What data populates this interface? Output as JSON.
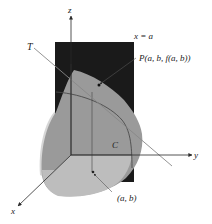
{
  "diagram": {
    "type": "3d-surface-tangent-line",
    "labels": {
      "z_axis": "z",
      "y_axis": "y",
      "x_axis": "x",
      "plane": "x = a",
      "tangent": "T",
      "point": "P(a, b, f(a, b))",
      "curve": "C",
      "base_point": "(a, b)"
    },
    "colors": {
      "plane": "#1a1a1a",
      "surface_dark": "#8e8e8e",
      "surface_light": "#c9c9c9",
      "surface_base": "#b5b5b5",
      "axis": "#2a2a2a",
      "tangent_line": "#8a8a8a",
      "curve": "#555555"
    }
  }
}
